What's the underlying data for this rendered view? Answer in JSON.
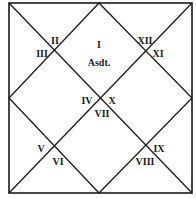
{
  "chart": {
    "style": "North Indian horoscope chart",
    "line_color": "#1a1a1a",
    "background": "#ffffff",
    "houses": [
      {
        "label": "I",
        "x": 99,
        "y": 46
      },
      {
        "label": "II",
        "x": 55,
        "y": 42
      },
      {
        "label": "III",
        "x": 42,
        "y": 55
      },
      {
        "label": "IV",
        "x": 87,
        "y": 102
      },
      {
        "label": "V",
        "x": 41,
        "y": 150
      },
      {
        "label": "VI",
        "x": 58,
        "y": 163
      },
      {
        "label": "VII",
        "x": 102,
        "y": 115
      },
      {
        "label": "VIII",
        "x": 145,
        "y": 163
      },
      {
        "label": "IX",
        "x": 159,
        "y": 150
      },
      {
        "label": "X",
        "x": 112,
        "y": 102
      },
      {
        "label": "XI",
        "x": 158,
        "y": 55
      },
      {
        "label": "XII",
        "x": 145,
        "y": 42
      }
    ],
    "ascendant": {
      "label": "Asdt.",
      "x": 99,
      "y": 64
    }
  }
}
